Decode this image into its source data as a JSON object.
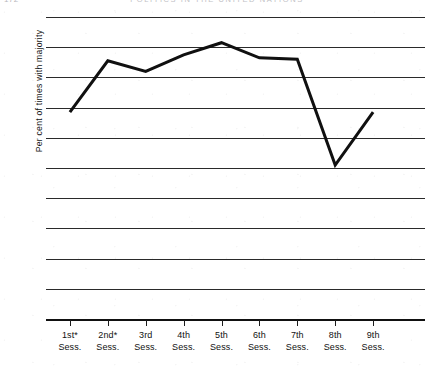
{
  "running_head": {
    "folio": "172",
    "title": "POLITICS IN THE UNITED NATIONS"
  },
  "chart_data": {
    "type": "line",
    "title": "",
    "subtitle": "",
    "xlabel": "",
    "ylabel": "Per cent of times with majority",
    "categories": [
      "1st*",
      "2nd*",
      "3rd",
      "4th",
      "5th",
      "6th",
      "7th",
      "8th",
      "9th"
    ],
    "category_suffix": "Sess.",
    "values": [
      68.5,
      85.5,
      82,
      87.5,
      91.5,
      86.5,
      86,
      51,
      68.5
    ],
    "series": [
      {
        "name": "Per cent of times with majority",
        "values": [
          68.5,
          85.5,
          82,
          87.5,
          91.5,
          86.5,
          86,
          51,
          68.5
        ]
      }
    ],
    "ylim": [
      0,
      100
    ],
    "yticks": [
      0,
      10,
      20,
      30,
      40,
      50,
      60,
      70,
      80,
      90,
      100
    ],
    "ytick_labels": [
      "0",
      "10",
      "20",
      "30",
      "40",
      "50",
      "60",
      "70",
      "80",
      "90",
      "100"
    ],
    "grid": "horizontal",
    "legend": "none",
    "line_color": "#101010",
    "grid_color": "#2a2a2a",
    "background_color": "#ffffff",
    "annotations": [
      "* asterisk on 1st and 2nd Sess. labels"
    ]
  }
}
